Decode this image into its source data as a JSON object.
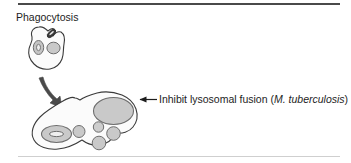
{
  "figure": {
    "width": 351,
    "height": 163,
    "background": "#ffffff",
    "rules": {
      "top_color": "#4a4a4a",
      "bottom_color": "#cfcfcf"
    }
  },
  "labels": {
    "phagocytosis": "Phagocytosis",
    "inhibit_prefix": "Inhibit lysosomal fusion (",
    "inhibit_organism": "M. tuberculosis",
    "inhibit_suffix": ")"
  },
  "diagram": {
    "type": "biology-schematic",
    "colors": {
      "outline": "#3b3b3b",
      "cell_fill": "#fbfbfb",
      "organelle_fill": "#c9c9c9",
      "organelle_stroke": "#6e6e6e",
      "nucleus_fill": "#c4c4c4",
      "nucleolus_fill": "#e8e8e8",
      "bacterium_fill": "#3a3a3a",
      "arrow_fill": "#4a4a4a",
      "pointer_color": "#1d1d1d"
    },
    "elements": [
      {
        "name": "upper-phagocyte-cell",
        "role": "macrophage engulfing bacterium"
      },
      {
        "name": "upper-cell-nucleus",
        "role": "nucleus with nucleolus"
      },
      {
        "name": "upper-cell-vesicle",
        "role": "phagosome vesicle"
      },
      {
        "name": "bacterium",
        "role": "M. tuberculosis being engulfed"
      },
      {
        "name": "process-arrow",
        "role": "curved arrow from upper to lower cell"
      },
      {
        "name": "lower-phagocyte-cell",
        "role": "macrophage after phagocytosis"
      },
      {
        "name": "large-phagosome",
        "role": "enlarged phagosome containing bacterium"
      },
      {
        "name": "lower-cell-nucleus",
        "role": "nucleus with nucleolus"
      },
      {
        "name": "lysosome-1",
        "role": "lysosome"
      },
      {
        "name": "lysosome-2",
        "role": "lysosome"
      },
      {
        "name": "lysosome-3",
        "role": "lysosome"
      },
      {
        "name": "lysosome-4",
        "role": "lysosome"
      },
      {
        "name": "pointer-arrow",
        "role": "annotation arrow to large phagosome"
      }
    ]
  }
}
